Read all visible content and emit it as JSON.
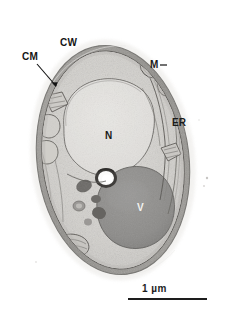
{
  "figure": {
    "kind": "transmission-electron-micrograph",
    "background_color": "#ffffff"
  },
  "labels": [
    {
      "id": "cm",
      "text": "CM",
      "meaning": "cell membrane",
      "x": 22,
      "y": 52,
      "leader": "arrow",
      "arrow": {
        "x1": 37,
        "y1": 64,
        "x2": 57,
        "y2": 88
      }
    },
    {
      "id": "cw",
      "text": "CW",
      "meaning": "cell wall",
      "x": 60,
      "y": 38,
      "leader": "none"
    },
    {
      "id": "m",
      "text": "M",
      "meaning": "mitochondrion",
      "x": 150,
      "y": 60,
      "leader": "tick",
      "tick": {
        "x1": 160,
        "y1": 65,
        "x2": 167,
        "y2": 65
      }
    },
    {
      "id": "er",
      "text": "ER",
      "meaning": "endoplasmic reticulum",
      "x": 172,
      "y": 118,
      "leader": "none"
    },
    {
      "id": "n",
      "text": "N",
      "meaning": "nucleus",
      "x": 105,
      "y": 131,
      "leader": "none"
    },
    {
      "id": "v",
      "text": "V",
      "meaning": "vacuole",
      "x": 137,
      "y": 203,
      "leader": "none"
    }
  ],
  "scalebar": {
    "label": "1 µm",
    "length_px": 79,
    "line_color": "#1d1d1d"
  },
  "colors": {
    "cytoplasm": "#d2d0cc",
    "nucleus": "#dcdad6",
    "vacuole": "#8e8d8b",
    "wall": "#9a9894",
    "membrane": "#6f6d6a",
    "granule": "#6a6865",
    "label_text": "#151515"
  }
}
